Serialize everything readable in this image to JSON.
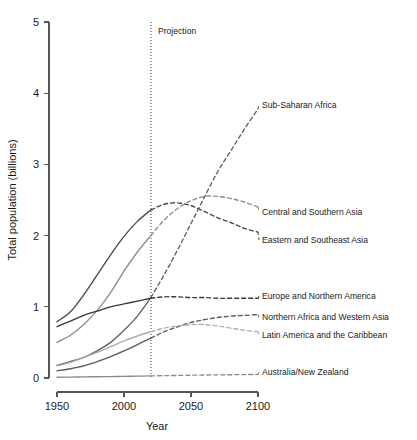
{
  "chart_data": {
    "type": "line",
    "title": "",
    "xlabel": "Year",
    "ylabel": "Total population (billions)",
    "xlim": [
      1950,
      2100
    ],
    "ylim": [
      0,
      5
    ],
    "xticks": [
      1950,
      2000,
      2050,
      2100
    ],
    "yticks": [
      0,
      1,
      2,
      3,
      4,
      5
    ],
    "grid": false,
    "legend_position": "right-inline-labels",
    "annotations": [
      {
        "text": "Projection",
        "x": 2020,
        "note": "vertical dotted line separating observed history from projected values"
      }
    ],
    "projection_start_year": 2020,
    "series": [
      {
        "name": "Sub-Saharan Africa",
        "color": "#606060",
        "x": [
          1950,
          1960,
          1970,
          1980,
          1990,
          2000,
          2010,
          2020,
          2030,
          2040,
          2050,
          2060,
          2070,
          2080,
          2090,
          2100
        ],
        "values": [
          0.18,
          0.23,
          0.29,
          0.38,
          0.5,
          0.67,
          0.87,
          1.13,
          1.45,
          1.8,
          2.17,
          2.54,
          2.9,
          3.2,
          3.5,
          3.78
        ]
      },
      {
        "name": "Central and Southern Asia",
        "color": "#8c8c8c",
        "x": [
          1950,
          1960,
          1970,
          1980,
          1990,
          2000,
          2010,
          2020,
          2030,
          2040,
          2050,
          2060,
          2070,
          2080,
          2090,
          2100
        ],
        "values": [
          0.5,
          0.6,
          0.75,
          0.95,
          1.2,
          1.5,
          1.77,
          2.0,
          2.22,
          2.38,
          2.49,
          2.55,
          2.55,
          2.52,
          2.47,
          2.4
        ]
      },
      {
        "name": "Eastern and Southeast Asia",
        "color": "#4a4a4a",
        "x": [
          1950,
          1960,
          1970,
          1980,
          1990,
          2000,
          2010,
          2020,
          2030,
          2040,
          2050,
          2060,
          2070,
          2080,
          2090,
          2100
        ],
        "values": [
          0.79,
          0.93,
          1.17,
          1.45,
          1.73,
          1.99,
          2.2,
          2.36,
          2.44,
          2.46,
          2.42,
          2.34,
          2.25,
          2.18,
          2.1,
          2.05
        ]
      },
      {
        "name": "Europe and Northern America",
        "color": "#3a3a3a",
        "x": [
          1950,
          1960,
          1970,
          1980,
          1990,
          2000,
          2010,
          2020,
          2030,
          2040,
          2050,
          2060,
          2070,
          2080,
          2090,
          2100
        ],
        "values": [
          0.72,
          0.8,
          0.88,
          0.94,
          1.0,
          1.04,
          1.08,
          1.12,
          1.14,
          1.14,
          1.13,
          1.13,
          1.12,
          1.12,
          1.12,
          1.12
        ]
      },
      {
        "name": "Northern Africa and Western Asia",
        "color": "#5a5a5a",
        "x": [
          1950,
          1960,
          1970,
          1980,
          1990,
          2000,
          2010,
          2020,
          2030,
          2040,
          2050,
          2060,
          2070,
          2080,
          2090,
          2100
        ],
        "values": [
          0.1,
          0.13,
          0.17,
          0.23,
          0.3,
          0.38,
          0.47,
          0.56,
          0.65,
          0.72,
          0.78,
          0.82,
          0.85,
          0.87,
          0.88,
          0.89
        ]
      },
      {
        "name": "Latin America and the Caribbean",
        "color": "#adadad",
        "x": [
          1950,
          1960,
          1970,
          1980,
          1990,
          2000,
          2010,
          2020,
          2030,
          2040,
          2050,
          2060,
          2070,
          2080,
          2090,
          2100
        ],
        "values": [
          0.17,
          0.22,
          0.29,
          0.36,
          0.44,
          0.52,
          0.59,
          0.65,
          0.7,
          0.73,
          0.75,
          0.75,
          0.73,
          0.7,
          0.67,
          0.65
        ]
      },
      {
        "name": "Australia/New Zealand",
        "color": "#8c8c8c",
        "x": [
          1950,
          1960,
          1970,
          1980,
          1990,
          2000,
          2010,
          2020,
          2030,
          2040,
          2050,
          2060,
          2070,
          2080,
          2090,
          2100
        ],
        "values": [
          0.01,
          0.013,
          0.016,
          0.018,
          0.02,
          0.023,
          0.026,
          0.03,
          0.033,
          0.036,
          0.039,
          0.042,
          0.044,
          0.046,
          0.048,
          0.05
        ]
      }
    ]
  },
  "axes": {
    "y_title": "Total population (billions)",
    "x_title": "Year",
    "y_tick_labels": [
      "0",
      "1",
      "2",
      "3",
      "4",
      "5"
    ],
    "x_tick_labels": [
      "1950",
      "2000",
      "2050",
      "2100"
    ]
  },
  "annotations": {
    "projection": "Projection"
  },
  "series_labels": {
    "sub_saharan_africa": "Sub-Saharan Africa",
    "central_southern_asia": "Central and Southern Asia",
    "eastern_southeast_asia": "Eastern and Southeast Asia",
    "europe_northern_america": "Europe and Northern America",
    "northern_africa_western_asia": "Northern Africa and Western Asia",
    "latin_america_caribbean": "Latin America and the Caribbean",
    "australia_new_zealand": "Australia/New Zealand"
  },
  "colors": {
    "axis": "#555555",
    "text": "#1a1a1a",
    "background": "#ffffff"
  }
}
